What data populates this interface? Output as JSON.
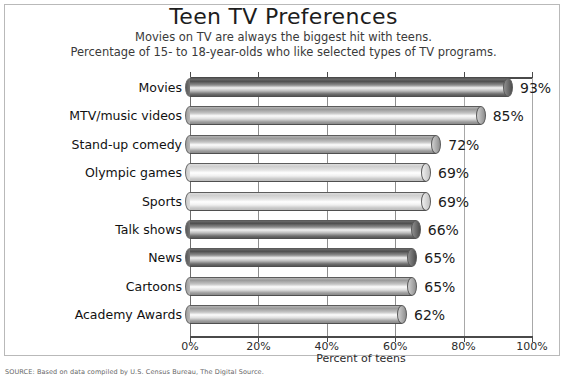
{
  "chart_data": {
    "type": "bar",
    "orientation": "horizontal",
    "title": "Teen TV Preferences",
    "subtitle_1": "Movies on TV are always the biggest hit with teens.",
    "subtitle_2": "Percentage of 15- to 18-year-olds who like selected types of TV programs.",
    "xlabel": "Percent of teens",
    "ylabel": "",
    "xlim": [
      0,
      100
    ],
    "grid": true,
    "legend": false,
    "categories": [
      "Movies",
      "MTV/music videos",
      "Stand-up comedy",
      "Olympic games",
      "Sports",
      "Talk shows",
      "News",
      "Cartoons",
      "Academy Awards"
    ],
    "values": [
      93,
      85,
      72,
      69,
      69,
      66,
      65,
      65,
      62
    ],
    "value_labels": [
      "93%",
      "85%",
      "72%",
      "69%",
      "69%",
      "66%",
      "65%",
      "65%",
      "62%"
    ],
    "xticks": [
      0,
      20,
      40,
      60,
      80,
      100
    ],
    "xtick_labels": [
      "0%",
      "20%",
      "40%",
      "60%",
      "80%",
      "100%"
    ],
    "bar_shades": [
      "dark",
      "medium",
      "medium",
      "light",
      "light",
      "dark",
      "dark",
      "medium",
      "medium"
    ],
    "colors": {
      "bar_dark": "#5a5a5a",
      "bar_mid": "#9b9b9b",
      "bar_light": "#d8d8d8",
      "highlight": "#ffffff",
      "axis": "#4a4a4a",
      "grid": "#8e8e8e",
      "text": "#111111",
      "frame": "#b9b9b9",
      "background": "#ffffff"
    }
  },
  "source_note": "SOURCE: Based on data compiled by U.S. Census Bureau, The Digital Source."
}
